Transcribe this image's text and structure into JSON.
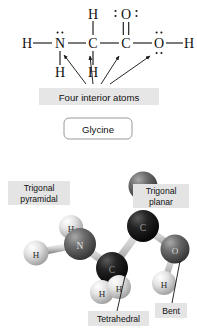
{
  "figure": {
    "molecule_name": "Glycine",
    "background": "#ffffff"
  },
  "lewis_structure": {
    "type": "lewis-dot-structure",
    "atoms": [
      {
        "id": "h-left",
        "label": "H",
        "x": 27,
        "y": 43,
        "lone_pairs": 0
      },
      {
        "id": "n",
        "label": "N",
        "x": 60,
        "y": 43,
        "lone_pairs": 1,
        "lone_pair_position": "top",
        "interior": true
      },
      {
        "id": "c-alpha",
        "label": "C",
        "x": 93,
        "y": 43,
        "lone_pairs": 0,
        "interior": true
      },
      {
        "id": "c-carbonyl",
        "label": "C",
        "x": 126,
        "y": 43,
        "lone_pairs": 0,
        "interior": true
      },
      {
        "id": "o-hydroxyl",
        "label": "O",
        "x": 159,
        "y": 43,
        "lone_pairs": 2,
        "lone_pair_position": "top-bottom",
        "interior": true
      },
      {
        "id": "h-right",
        "label": "H",
        "x": 189,
        "y": 43,
        "lone_pairs": 0
      },
      {
        "id": "h-top-c",
        "label": "H",
        "x": 93,
        "y": 14,
        "lone_pairs": 0
      },
      {
        "id": "o-carbonyl",
        "label": "O",
        "x": 126,
        "y": 14,
        "lone_pairs": 2,
        "lone_pair_position": "left-right"
      },
      {
        "id": "h-below-n",
        "label": "H",
        "x": 60,
        "y": 72,
        "lone_pairs": 0
      },
      {
        "id": "h-below-c",
        "label": "H",
        "x": 93,
        "y": 72,
        "lone_pairs": 0
      }
    ],
    "bonds": [
      {
        "from": "h-left",
        "to": "n",
        "order": 1
      },
      {
        "from": "n",
        "to": "c-alpha",
        "order": 1
      },
      {
        "from": "c-alpha",
        "to": "c-carbonyl",
        "order": 1
      },
      {
        "from": "c-carbonyl",
        "to": "o-hydroxyl",
        "order": 1
      },
      {
        "from": "o-hydroxyl",
        "to": "h-right",
        "order": 1
      },
      {
        "from": "c-alpha",
        "to": "h-top-c",
        "order": 1
      },
      {
        "from": "c-carbonyl",
        "to": "o-carbonyl",
        "order": 2
      },
      {
        "from": "n",
        "to": "h-below-n",
        "order": 1
      },
      {
        "from": "c-alpha",
        "to": "h-below-c",
        "order": 1
      }
    ],
    "callout": {
      "text": "Four interior atoms",
      "arrow_count": 4,
      "arrow_targets": [
        "n",
        "c-alpha",
        "c-carbonyl",
        "o-hydroxyl"
      ],
      "box_fill": "#e6e6e6"
    }
  },
  "name_badge": {
    "text": "Glycine",
    "border": "#9a9a9a"
  },
  "model_3d": {
    "type": "ball-and-stick",
    "atoms": [
      {
        "id": "m-h-nl",
        "label": "H",
        "x": 36,
        "y": 253,
        "r": 12.5,
        "shade": "light"
      },
      {
        "id": "m-h-ntop",
        "label": "H",
        "x": 71,
        "y": 227,
        "r": 12,
        "shade": "light"
      },
      {
        "id": "m-n",
        "label": "N",
        "x": 80,
        "y": 244,
        "r": 16,
        "shade": "medium"
      },
      {
        "id": "m-c-alpha",
        "label": "C",
        "x": 112,
        "y": 268,
        "r": 16,
        "shade": "dark"
      },
      {
        "id": "m-h-c1",
        "label": "H",
        "x": 102,
        "y": 292,
        "r": 12,
        "shade": "light"
      },
      {
        "id": "m-h-c2",
        "label": "H",
        "x": 119,
        "y": 287,
        "r": 12,
        "shade": "light"
      },
      {
        "id": "m-c-carb",
        "label": "C",
        "x": 143,
        "y": 226,
        "r": 16,
        "shade": "dark"
      },
      {
        "id": "m-o-top",
        "label": "O",
        "x": 143,
        "y": 186,
        "r": 14.5,
        "shade": "medium"
      },
      {
        "id": "m-o-oh",
        "label": "O",
        "x": 175,
        "y": 249,
        "r": 14.5,
        "shade": "medium"
      },
      {
        "id": "m-h-oh",
        "label": "H",
        "x": 164,
        "y": 283,
        "r": 12,
        "shade": "light"
      }
    ],
    "bonds": [
      {
        "from": "m-h-nl",
        "to": "m-n",
        "order": 1
      },
      {
        "from": "m-h-ntop",
        "to": "m-n",
        "order": 1
      },
      {
        "from": "m-n",
        "to": "m-c-alpha",
        "order": 1
      },
      {
        "from": "m-c-alpha",
        "to": "m-h-c1",
        "order": 1
      },
      {
        "from": "m-c-alpha",
        "to": "m-h-c2",
        "order": 1
      },
      {
        "from": "m-c-alpha",
        "to": "m-c-carb",
        "order": 1
      },
      {
        "from": "m-c-carb",
        "to": "m-o-top",
        "order": 2
      },
      {
        "from": "m-c-carb",
        "to": "m-o-oh",
        "order": 1
      },
      {
        "from": "m-o-oh",
        "to": "m-h-oh",
        "order": 1
      }
    ],
    "annotations": [
      {
        "id": "ann-trig-pyr",
        "lines": [
          "Trigonal",
          "pyramidal"
        ],
        "x": 8,
        "y": 181,
        "w": 62,
        "h": 24,
        "describes": "m-n"
      },
      {
        "id": "ann-trig-pl",
        "lines": [
          "Trigonal",
          "planar"
        ],
        "x": 133,
        "y": 184,
        "w": 56,
        "h": 24,
        "describes": "m-c-carb"
      },
      {
        "id": "ann-tetra",
        "lines": [
          "Tetrahedral"
        ],
        "x": 88,
        "y": 311,
        "w": 61,
        "h": 14,
        "describes": "m-c-alpha"
      },
      {
        "id": "ann-bent",
        "lines": [
          "Bent"
        ],
        "x": 155,
        "y": 303,
        "w": 30,
        "h": 14,
        "describes": "m-o-oh"
      }
    ],
    "shades": {
      "light": "#d2d2d2",
      "medium": "#6e6e6e",
      "dark": "#1c1c1c",
      "bond": "#c4c4c4",
      "label_box_fill": "#e4e4e4"
    }
  }
}
